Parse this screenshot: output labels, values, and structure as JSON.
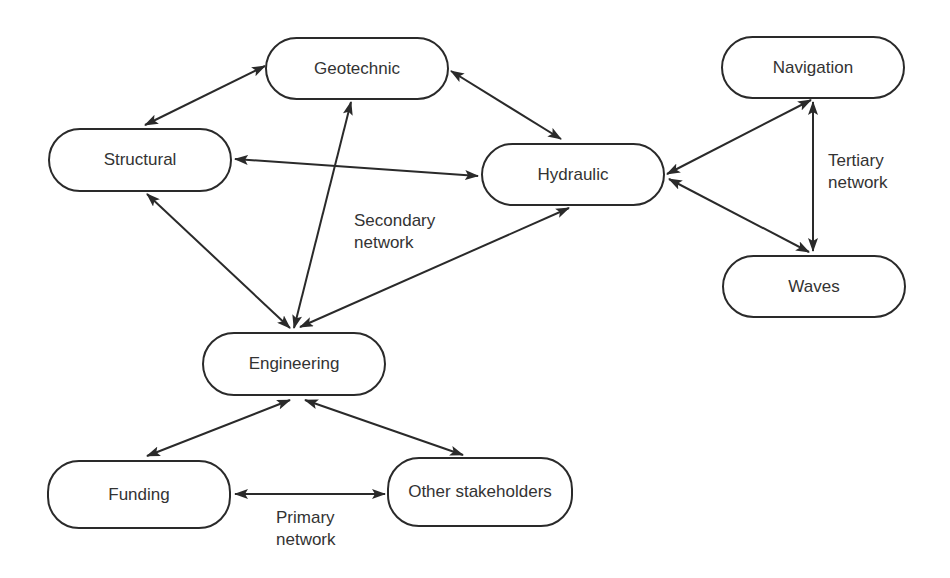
{
  "diagram": {
    "type": "network",
    "nodes": [
      {
        "id": "geotechnic",
        "label": "Geotechnic",
        "x": 265,
        "y": 37,
        "w": 184,
        "h": 63
      },
      {
        "id": "structural",
        "label": "Structural",
        "x": 48,
        "y": 128,
        "w": 184,
        "h": 64
      },
      {
        "id": "hydraulic",
        "label": "Hydraulic",
        "x": 481,
        "y": 143,
        "w": 184,
        "h": 63
      },
      {
        "id": "navigation",
        "label": "Navigation",
        "x": 721,
        "y": 36,
        "w": 184,
        "h": 63
      },
      {
        "id": "waves",
        "label": "Waves",
        "x": 722,
        "y": 255,
        "w": 184,
        "h": 63
      },
      {
        "id": "engineering",
        "label": "Engineering",
        "x": 202,
        "y": 332,
        "w": 184,
        "h": 64
      },
      {
        "id": "funding",
        "label": "Funding",
        "x": 47,
        "y": 460,
        "w": 184,
        "h": 69
      },
      {
        "id": "other",
        "label": "Other stakeholders",
        "x": 387,
        "y": 457,
        "w": 186,
        "h": 70
      }
    ],
    "edges": [
      {
        "from": "structural",
        "to": "geotechnic",
        "x1": 145,
        "y1": 125,
        "x2": 265,
        "y2": 66
      },
      {
        "from": "geotechnic",
        "to": "hydraulic",
        "x1": 451,
        "y1": 71,
        "x2": 561,
        "y2": 139
      },
      {
        "from": "structural",
        "to": "hydraulic",
        "x1": 235,
        "y1": 159,
        "x2": 478,
        "y2": 176
      },
      {
        "from": "geotechnic",
        "to": "engineering",
        "x1": 351,
        "y1": 102,
        "x2": 294,
        "y2": 328
      },
      {
        "from": "structural",
        "to": "engineering",
        "x1": 147,
        "y1": 194,
        "x2": 290,
        "y2": 328
      },
      {
        "from": "hydraulic",
        "to": "engineering",
        "x1": 569,
        "y1": 208,
        "x2": 300,
        "y2": 327
      },
      {
        "from": "navigation",
        "to": "hydraulic",
        "x1": 811,
        "y1": 100,
        "x2": 667,
        "y2": 174
      },
      {
        "from": "hydraulic",
        "to": "waves",
        "x1": 669,
        "y1": 179,
        "x2": 809,
        "y2": 252
      },
      {
        "from": "navigation",
        "to": "waves",
        "x1": 813,
        "y1": 102,
        "x2": 813,
        "y2": 251
      },
      {
        "from": "engineering",
        "to": "funding",
        "x1": 290,
        "y1": 400,
        "x2": 147,
        "y2": 456
      },
      {
        "from": "engineering",
        "to": "other",
        "x1": 305,
        "y1": 400,
        "x2": 463,
        "y2": 455
      },
      {
        "from": "funding",
        "to": "other",
        "x1": 235,
        "y1": 494,
        "x2": 385,
        "y2": 494
      }
    ],
    "annotations": [
      {
        "id": "secondary",
        "line1": "Secondary",
        "line2": "network",
        "x": 354,
        "y": 210
      },
      {
        "id": "tertiary",
        "line1": "Tertiary",
        "line2": "network",
        "x": 828,
        "y": 150
      },
      {
        "id": "primary",
        "line1": "Primary",
        "line2": "network",
        "x": 276,
        "y": 507
      }
    ],
    "colors": {
      "stroke": "#2a2a2a",
      "text": "#333333",
      "background": "#ffffff"
    }
  }
}
